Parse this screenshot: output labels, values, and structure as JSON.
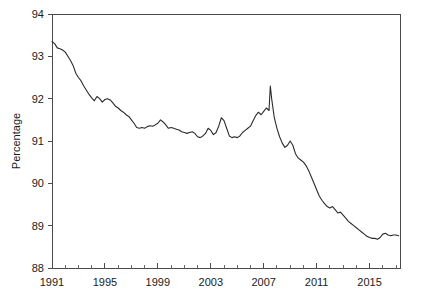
{
  "chart_data": {
    "type": "line",
    "title": "",
    "subtitle": "",
    "xlabel": "",
    "ylabel": "Percentage",
    "xlim": [
      1991.0,
      2017.3
    ],
    "ylim": [
      88,
      94
    ],
    "grid": false,
    "legend": null,
    "legend_position": "none",
    "line_color": "#2b2b2b",
    "axis_color": "#4a4a4a",
    "background_color": "#ffffff",
    "y_ticks": [
      88,
      89,
      90,
      91,
      92,
      93,
      94
    ],
    "y_tick_labels": [
      "88",
      "89",
      "90",
      "91",
      "92",
      "93",
      "94"
    ],
    "x_ticks_major": [
      1991,
      1995,
      1999,
      2003,
      2007,
      2011,
      2015
    ],
    "x_tick_labels": [
      "1991",
      "1995",
      "1999",
      "2003",
      "2007",
      "2011",
      "2015"
    ],
    "x_ticks_minor": [
      1992,
      1993,
      1994,
      1996,
      1997,
      1998,
      2000,
      2001,
      2002,
      2004,
      2005,
      2006,
      2008,
      2009,
      2010,
      2012,
      2013,
      2014,
      2016,
      2017
    ],
    "series": [
      {
        "name": "Percentage",
        "x": [
          1991.0,
          1991.2,
          1991.4,
          1991.6,
          1991.8,
          1992.0,
          1992.2,
          1992.4,
          1992.6,
          1992.8,
          1993.0,
          1993.2,
          1993.4,
          1993.6,
          1993.8,
          1994.0,
          1994.2,
          1994.4,
          1994.6,
          1994.8,
          1995.0,
          1995.2,
          1995.4,
          1995.6,
          1995.8,
          1996.0,
          1996.2,
          1996.4,
          1996.6,
          1996.8,
          1997.0,
          1997.2,
          1997.4,
          1997.6,
          1997.8,
          1998.0,
          1998.2,
          1998.4,
          1998.6,
          1998.8,
          1999.0,
          1999.2,
          1999.4,
          1999.6,
          1999.8,
          2000.0,
          2000.2,
          2000.4,
          2000.6,
          2000.8,
          2001.0,
          2001.2,
          2001.4,
          2001.6,
          2001.8,
          2002.0,
          2002.2,
          2002.4,
          2002.6,
          2002.8,
          2003.0,
          2003.2,
          2003.4,
          2003.6,
          2003.8,
          2004.0,
          2004.2,
          2004.4,
          2004.6,
          2004.8,
          2005.0,
          2005.2,
          2005.4,
          2005.6,
          2005.8,
          2006.0,
          2006.2,
          2006.4,
          2006.6,
          2006.8,
          2007.0,
          2007.2,
          2007.4,
          2007.5,
          2007.6,
          2007.8,
          2008.0,
          2008.2,
          2008.4,
          2008.6,
          2008.8,
          2009.0,
          2009.2,
          2009.4,
          2009.6,
          2009.8,
          2010.0,
          2010.2,
          2010.4,
          2010.6,
          2010.8,
          2011.0,
          2011.2,
          2011.4,
          2011.6,
          2011.8,
          2012.0,
          2012.2,
          2012.4,
          2012.6,
          2012.8,
          2013.0,
          2013.2,
          2013.4,
          2013.6,
          2013.8,
          2014.0,
          2014.2,
          2014.4,
          2014.6,
          2014.8,
          2015.0,
          2015.2,
          2015.4,
          2015.6,
          2015.8,
          2016.0,
          2016.2,
          2016.4,
          2016.6,
          2016.8,
          2017.0,
          2017.2
        ],
        "values": [
          93.35,
          93.3,
          93.2,
          93.18,
          93.15,
          93.1,
          93.0,
          92.9,
          92.78,
          92.6,
          92.5,
          92.42,
          92.3,
          92.2,
          92.1,
          92.02,
          91.95,
          92.05,
          92.0,
          91.92,
          91.98,
          92.0,
          91.97,
          91.9,
          91.82,
          91.78,
          91.72,
          91.68,
          91.62,
          91.58,
          91.5,
          91.42,
          91.32,
          91.3,
          91.32,
          91.3,
          91.34,
          91.36,
          91.35,
          91.38,
          91.42,
          91.5,
          91.45,
          91.38,
          91.3,
          91.32,
          91.3,
          91.28,
          91.26,
          91.22,
          91.2,
          91.18,
          91.2,
          91.22,
          91.18,
          91.1,
          91.08,
          91.12,
          91.18,
          91.3,
          91.25,
          91.15,
          91.2,
          91.35,
          91.55,
          91.48,
          91.3,
          91.12,
          91.08,
          91.1,
          91.08,
          91.12,
          91.2,
          91.25,
          91.3,
          91.35,
          91.48,
          91.6,
          91.68,
          91.62,
          91.7,
          91.78,
          91.72,
          92.3,
          92.0,
          91.55,
          91.3,
          91.1,
          90.95,
          90.85,
          90.9,
          91.0,
          90.9,
          90.7,
          90.6,
          90.55,
          90.5,
          90.42,
          90.3,
          90.15,
          90.0,
          89.85,
          89.7,
          89.6,
          89.52,
          89.45,
          89.42,
          89.45,
          89.38,
          89.3,
          89.32,
          89.25,
          89.18,
          89.1,
          89.05,
          89.0,
          88.95,
          88.9,
          88.85,
          88.8,
          88.75,
          88.72,
          88.7,
          88.7,
          88.68,
          88.72,
          88.8,
          88.82,
          88.78,
          88.76,
          88.78,
          88.78,
          88.76
        ]
      }
    ]
  },
  "axes": {
    "ylabel": "Percentage"
  }
}
